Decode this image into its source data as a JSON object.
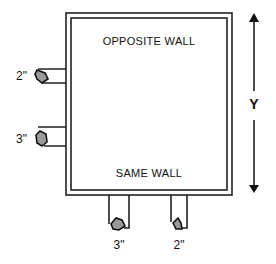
{
  "diagram": {
    "walls": {
      "opposite_label": "OPPOSITE WALL",
      "same_label": "SAME WALL"
    },
    "dimension": {
      "axis_label": "Y"
    },
    "side_connections": [
      {
        "size_label": "2\""
      },
      {
        "size_label": "3\""
      }
    ],
    "bottom_connections": [
      {
        "size_label": "3\""
      },
      {
        "size_label": "2\""
      }
    ],
    "colors": {
      "line": "#222222",
      "valve_fill": "#9a9a9a",
      "background": "#ffffff"
    }
  }
}
